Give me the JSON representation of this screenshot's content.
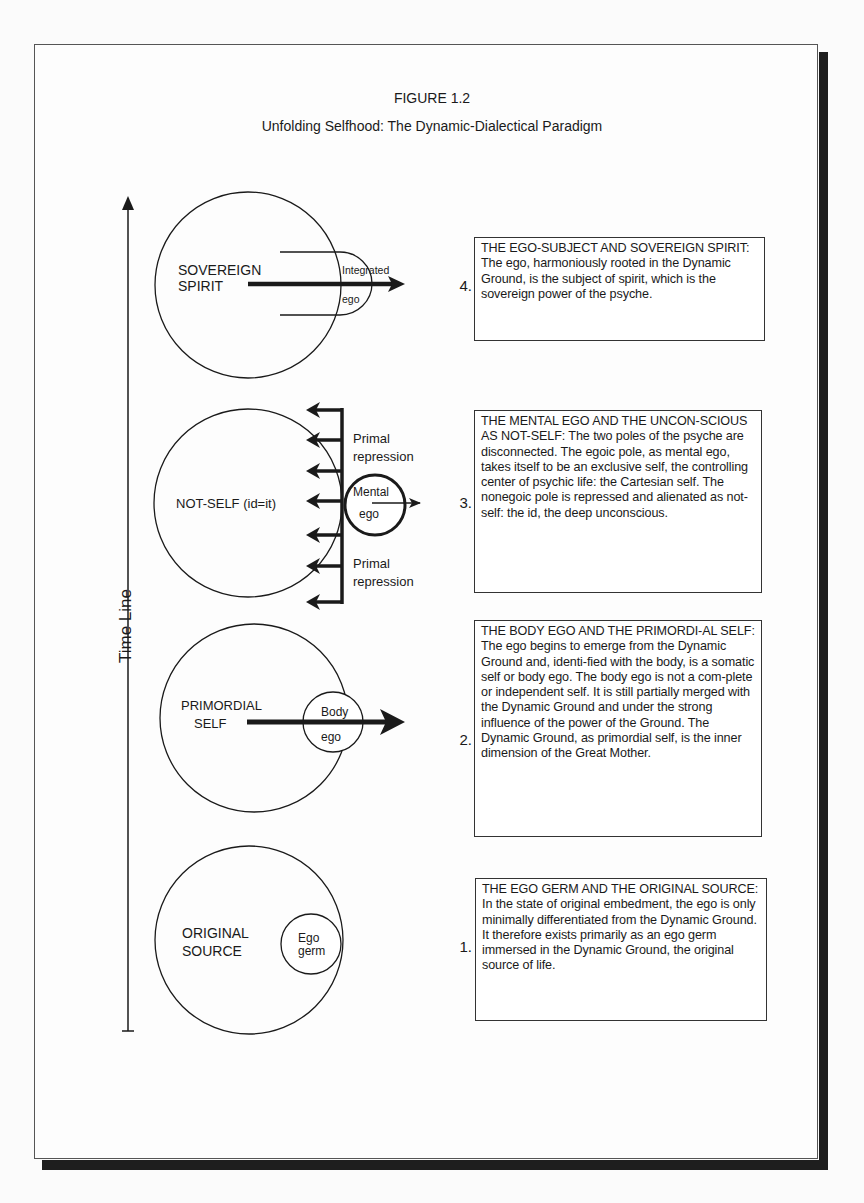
{
  "figure": {
    "label": "FIGURE 1.2",
    "title": "Unfolding Selfhood: The Dynamic-Dialectical Paradigm"
  },
  "timeline": {
    "label": "Time Line"
  },
  "stages": [
    {
      "number": "1.",
      "circle_label_line1": "ORIGINAL",
      "circle_label_line2": "SOURCE",
      "ego_label_line1": "Ego",
      "ego_label_line2": "germ",
      "description": "THE EGO GERM AND THE ORIGINAL SOURCE: In the state of original embedment, the ego is only minimally differentiated from the Dynamic Ground. It therefore exists primarily as an ego germ immersed in the Dynamic Ground, the original source of life."
    },
    {
      "number": "2.",
      "circle_label_line1": "PRIMORDIAL",
      "circle_label_line2": "SELF",
      "ego_label_line1": "Body",
      "ego_label_line2": "ego",
      "description": "THE BODY EGO AND THE PRIMORDI-AL SELF: The ego begins to emerge from the Dynamic Ground and, identi-fied with the body, is a somatic self or body ego. The body ego is not a com-plete or independent self.  It is still partially merged with the Dynamic Ground and under the strong influence of the power of the Ground. The Dynamic Ground, as primordial self, is the inner dimension of the Great Mother."
    },
    {
      "number": "3.",
      "circle_label_line1": "NOT-SELF (id=it)",
      "ego_label_line1": "Mental",
      "ego_label_line2": "ego",
      "repression_top_line1": "Primal",
      "repression_top_line2": "repression",
      "repression_bottom_line1": "Primal",
      "repression_bottom_line2": "repression",
      "description": "THE MENTAL EGO AND THE UNCON-SCIOUS AS NOT-SELF: The two poles of the psyche are disconnected. The egoic pole, as mental ego, takes itself to be an exclusive self, the controlling center of psychic life: the Cartesian self. The nonegoic pole is repressed and alienated as not-self: the id, the deep unconscious."
    },
    {
      "number": "4.",
      "circle_label_line1": "SOVEREIGN",
      "circle_label_line2": "SPIRIT",
      "ego_label_line1": "Integrated",
      "ego_label_line2": "ego",
      "description": "THE EGO-SUBJECT AND SOVEREIGN SPIRIT: The ego, harmoniously rooted in the Dynamic Ground, is the subject of spirit, which is the sovereign power of the psyche."
    }
  ],
  "colors": {
    "ink": "#1a1a1a",
    "page": "#fdfdfd",
    "shadow": "#1e1e1e"
  }
}
